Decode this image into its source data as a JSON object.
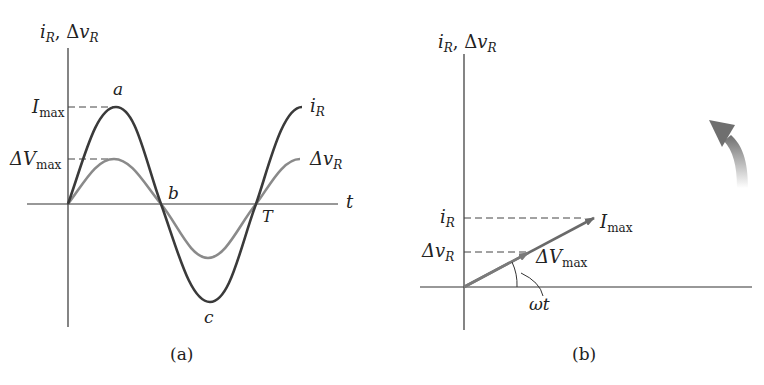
{
  "panel_a": {
    "y_axis_label_main": "i",
    "y_axis_label_sub": "R",
    "y_axis_label_sep": ", Δ",
    "y_axis_label_main2": "v",
    "y_axis_label_sub2": "R",
    "x_axis_label": "t",
    "imax_label_main": "I",
    "imax_label_sub": "max",
    "vmax_label_main": "ΔV",
    "vmax_label_sub": "max",
    "point_a": "a",
    "point_b": "b",
    "point_c": "c",
    "point_T": "T",
    "curve_i_label_main": "i",
    "curve_i_label_sub": "R",
    "curve_v_label_main": "Δv",
    "curve_v_label_sub": "R",
    "caption": "(a)",
    "colors": {
      "current": "#3a3a3a",
      "voltage": "#8a8a8a",
      "axis": "#333333"
    }
  },
  "panel_b": {
    "y_axis_label_main": "i",
    "y_axis_label_sub": "R",
    "y_axis_label_sep": ", Δ",
    "y_axis_label_main2": "v",
    "y_axis_label_sub2": "R",
    "iR_tick_main": "i",
    "iR_tick_sub": "R",
    "vR_tick_main": "Δv",
    "vR_tick_sub": "R",
    "imax_phasor_main": "I",
    "imax_phasor_sub": "max",
    "vmax_phasor_main": "ΔV",
    "vmax_phasor_sub": "max",
    "angle_label": "ωt",
    "rotation_arrow": "counterclockwise-rotation-arrow",
    "caption": "(b)",
    "colors": {
      "phasor": "#7a7a7a",
      "axis": "#333333",
      "rotation_arrow": "#888888"
    }
  }
}
